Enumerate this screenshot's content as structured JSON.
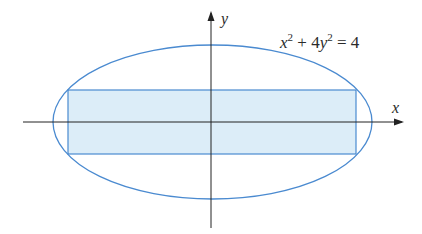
{
  "diagram": {
    "equation": {
      "x": "x",
      "sup1": "2",
      "plus": " + 4",
      "y": "y",
      "sup2": "2",
      "rhs": " = 4"
    },
    "axes": {
      "x_label": "x",
      "y_label": "y"
    },
    "colors": {
      "ellipse_stroke": "#4a8ad0",
      "rect_stroke": "#4a8ad0",
      "rect_fill": "#dcedf8",
      "axis": "#222222"
    },
    "shapes": {
      "ellipse": {
        "cx": 212.5,
        "cy": 122,
        "rx": 159.5,
        "ry": 77
      },
      "rectangle": {
        "x": 68,
        "y": 90,
        "width": 288,
        "height": 64
      },
      "x_axis": {
        "x1": 23,
        "x2": 402,
        "y": 122
      },
      "y_axis": {
        "x": 211,
        "y1": 228,
        "y2": 13
      }
    }
  }
}
